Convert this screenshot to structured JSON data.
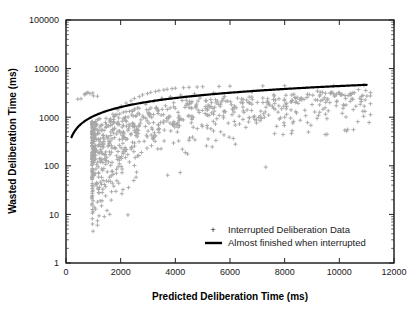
{
  "chart_data": {
    "type": "scatter",
    "title": "",
    "xlabel": "Predicted Deliberation Time (ms)",
    "ylabel": "Wasted Deliberation Time (ms)",
    "xlim": [
      0,
      12000
    ],
    "ylim": [
      1,
      100000
    ],
    "xscale": "linear",
    "yscale": "log",
    "grid": false,
    "legend_position": "lower-right",
    "xticks": [
      0,
      2000,
      4000,
      6000,
      8000,
      10000,
      12000
    ],
    "xticklabels": [
      "0",
      "2000",
      "4000",
      "6000",
      "8000",
      "10000",
      "12000"
    ],
    "yticks": [
      1,
      10,
      100,
      1000,
      10000,
      100000
    ],
    "yticklabels": [
      "1",
      "10",
      "100",
      "1000",
      "10000",
      "100000"
    ],
    "yminor_ticks": true,
    "series": [
      {
        "name": "Interrupted Deliberation Data",
        "type": "scatter",
        "marker": "+",
        "color": "#a8a8a8",
        "n_points": 760,
        "description": "Dense wedge-shaped cluster of gray plus markers; bulk between x=1000-4000 with wasted time 30-3000 ms, thinning tail extending to x=11000",
        "points": [
          [
            1050,
            160
          ],
          [
            1120,
            210
          ],
          [
            1180,
            95
          ],
          [
            1240,
            310
          ],
          [
            1300,
            58
          ],
          [
            1360,
            420
          ],
          [
            1420,
            140
          ],
          [
            1480,
            640
          ],
          [
            1540,
            250
          ],
          [
            1600,
            880
          ],
          [
            1660,
            190
          ],
          [
            1720,
            1150
          ],
          [
            1780,
            380
          ],
          [
            1840,
            70
          ],
          [
            1900,
            1420
          ],
          [
            1960,
            520
          ],
          [
            2020,
            1680
          ],
          [
            2080,
            290
          ],
          [
            2140,
            960
          ],
          [
            2200,
            1950
          ],
          [
            2260,
            170
          ],
          [
            2320,
            1320
          ],
          [
            2380,
            2180
          ],
          [
            2440,
            640
          ],
          [
            2500,
            2420
          ],
          [
            2560,
            420
          ],
          [
            2620,
            1560
          ],
          [
            2680,
            2650
          ],
          [
            2740,
            880
          ],
          [
            2800,
            2880
          ],
          [
            2860,
            320
          ],
          [
            2920,
            1840
          ],
          [
            2980,
            3060
          ],
          [
            3040,
            1180
          ],
          [
            3100,
            3240
          ],
          [
            3160,
            560
          ],
          [
            3220,
            2120
          ],
          [
            3280,
            3380
          ],
          [
            3340,
            1460
          ],
          [
            3400,
            3520
          ],
          [
            3460,
            780
          ],
          [
            3520,
            2380
          ],
          [
            3580,
            3640
          ],
          [
            3640,
            1720
          ],
          [
            3700,
            3760
          ],
          [
            3760,
            1020
          ],
          [
            3820,
            2620
          ],
          [
            3880,
            3860
          ],
          [
            3940,
            1980
          ],
          [
            4000,
            3950
          ],
          [
            4100,
            1260
          ],
          [
            4200,
            2840
          ],
          [
            4300,
            4040
          ],
          [
            4400,
            2240
          ],
          [
            4500,
            4120
          ],
          [
            4600,
            1520
          ],
          [
            4700,
            3020
          ],
          [
            4800,
            4180
          ],
          [
            4900,
            2480
          ],
          [
            5000,
            4240
          ],
          [
            5200,
            1780
          ],
          [
            5400,
            3180
          ],
          [
            5600,
            4300
          ],
          [
            5800,
            2680
          ],
          [
            6000,
            4350
          ],
          [
            6400,
            2020
          ],
          [
            6800,
            3320
          ],
          [
            7200,
            4400
          ],
          [
            7600,
            2880
          ],
          [
            8000,
            4440
          ],
          [
            8600,
            2260
          ],
          [
            9200,
            3440
          ],
          [
            9800,
            4480
          ],
          [
            10400,
            3080
          ],
          [
            10900,
            4520
          ],
          [
            1100,
            42
          ],
          [
            1200,
            28
          ],
          [
            1300,
            15
          ],
          [
            1400,
            9
          ],
          [
            1500,
            12
          ],
          [
            1150,
            6
          ],
          [
            1250,
            19
          ],
          [
            1350,
            33
          ],
          [
            1450,
            24
          ],
          [
            1550,
            48
          ],
          [
            1650,
            62
          ],
          [
            1750,
            38
          ],
          [
            1850,
            85
          ],
          [
            1950,
            110
          ],
          [
            2050,
            72
          ],
          [
            550,
            2400
          ],
          [
            680,
            2900
          ],
          [
            760,
            3100
          ],
          [
            880,
            3050
          ],
          [
            1000,
            2750
          ],
          [
            3500,
            2450
          ],
          [
            4250,
            2200
          ],
          [
            5100,
            1650
          ],
          [
            6100,
            1420
          ],
          [
            6700,
            980
          ],
          [
            7400,
            1850
          ],
          [
            8300,
            760
          ],
          [
            9100,
            1280
          ],
          [
            10200,
            540
          ],
          [
            10800,
            2100
          ]
        ]
      },
      {
        "name": "Almost finished when interrupted",
        "type": "line",
        "color": "#000000",
        "linewidth": 2.2,
        "description": "Smooth monotonic curve, upper envelope of the scatter; log-shaped rising from (200, 200) to (11000, 11000)",
        "points": [
          [
            200,
            200
          ],
          [
            400,
            400
          ],
          [
            600,
            600
          ],
          [
            800,
            800
          ],
          [
            1000,
            1000
          ],
          [
            1300,
            1290
          ],
          [
            1600,
            1570
          ],
          [
            2000,
            1920
          ],
          [
            2400,
            2260
          ],
          [
            3000,
            2740
          ],
          [
            3600,
            3180
          ],
          [
            4200,
            3580
          ],
          [
            5000,
            4080
          ],
          [
            6000,
            4660
          ],
          [
            7000,
            5200
          ],
          [
            8000,
            5700
          ],
          [
            9000,
            6180
          ],
          [
            10000,
            6620
          ],
          [
            11000,
            7050
          ]
        ]
      }
    ],
    "legend_entries": [
      {
        "label": "Interrupted Deliberation Data",
        "marker": "plus",
        "color": "#a8a8a8"
      },
      {
        "label": "Almost finished when interrupted",
        "marker": "line",
        "color": "#000000"
      }
    ]
  }
}
